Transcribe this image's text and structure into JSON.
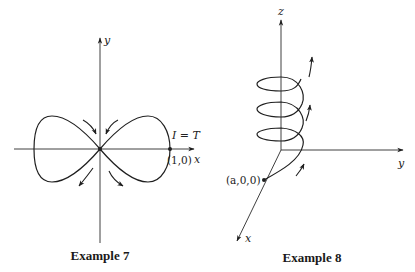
{
  "example7": {
    "caption": "Example 7",
    "axis_x_label": "x",
    "axis_y_label": "y",
    "annotation": "I = T",
    "point_label": "(1,0)",
    "curve": "lemniscate (figure-eight) through origin"
  },
  "example8": {
    "caption": "Example 8",
    "axis_x_label": "x",
    "axis_y_label": "y",
    "axis_z_label": "z",
    "point_label": "(a,0,0)",
    "curve": "helix around z-axis, three turns"
  },
  "colors": {
    "ink": "#1f1f1f",
    "background": "#ffffff"
  }
}
